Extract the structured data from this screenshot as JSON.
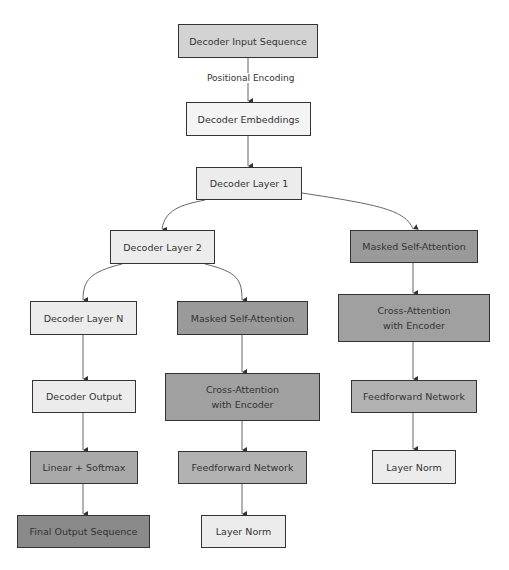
{
  "diagram": {
    "type": "flowchart",
    "colors": {
      "input": "#d3d3d3",
      "light": "#ececec",
      "masked_attention": "#9a9a9a",
      "cross_attention": "#a0a0a0",
      "feedforward": "#b2b2b2",
      "linear_softmax": "#a9a9a9",
      "final_output": "#8a8a8a",
      "border": "#333333",
      "edge": "#555555"
    },
    "nodes": {
      "input": "Decoder Input Sequence",
      "embeddings": "Decoder Embeddings",
      "layer1": "Decoder Layer 1",
      "layer2": "Decoder Layer 2",
      "masked_sa_right": "Masked Self-Attention",
      "cross_attn_right": "Cross-Attention with Encoder",
      "ff_right": "Feedforward Network",
      "norm_right": "Layer Norm",
      "layerN": "Decoder Layer N",
      "masked_sa_mid": "Masked Self-Attention",
      "cross_attn_mid": "Cross-Attention with Encoder",
      "ff_mid": "Feedforward Network",
      "norm_mid": "Layer Norm",
      "output": "Decoder Output",
      "linear_softmax": "Linear + Softmax",
      "final": "Final Output Sequence"
    },
    "edge_labels": {
      "input_to_embeddings": "Positional Encoding"
    },
    "edges": [
      [
        "input",
        "embeddings"
      ],
      [
        "embeddings",
        "layer1"
      ],
      [
        "layer1",
        "layer2"
      ],
      [
        "layer1",
        "masked_sa_right"
      ],
      [
        "masked_sa_right",
        "cross_attn_right"
      ],
      [
        "cross_attn_right",
        "ff_right"
      ],
      [
        "ff_right",
        "norm_right"
      ],
      [
        "layer2",
        "layerN"
      ],
      [
        "layer2",
        "masked_sa_mid"
      ],
      [
        "masked_sa_mid",
        "cross_attn_mid"
      ],
      [
        "cross_attn_mid",
        "ff_mid"
      ],
      [
        "ff_mid",
        "norm_mid"
      ],
      [
        "layerN",
        "output"
      ],
      [
        "output",
        "linear_softmax"
      ],
      [
        "linear_softmax",
        "final"
      ]
    ]
  }
}
